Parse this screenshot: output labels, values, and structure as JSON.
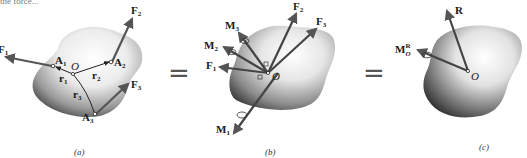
{
  "figure": {
    "top_text_fragment": "the force...",
    "panels": [
      {
        "id": "a",
        "caption": "(a)",
        "labels": {
          "F1": "F",
          "F1_sub": "1",
          "F2": "F",
          "F2_sub": "2",
          "F3": "F",
          "F3_sub": "3",
          "A1": "A",
          "A1_sub": "1",
          "A2": "A",
          "A2_sub": "2",
          "A3": "A",
          "A3_sub": "3",
          "r1": "r",
          "r1_sub": "1",
          "r2": "r",
          "r2_sub": "2",
          "r3": "r",
          "r3_sub": "3",
          "O": "O"
        }
      },
      {
        "id": "b",
        "caption": "(b)",
        "labels": {
          "F1": "F",
          "F1_sub": "1",
          "F2": "F",
          "F2_sub": "2",
          "F3": "F",
          "F3_sub": "3",
          "M1": "M",
          "M1_sub": "1",
          "M2": "M",
          "M2_sub": "2",
          "M3": "M",
          "M3_sub": "3",
          "O": "O"
        }
      },
      {
        "id": "c",
        "caption": "(c)",
        "labels": {
          "R": "R",
          "MO": "M",
          "MO_sub": "O",
          "MO_sup": "R",
          "O": "O"
        }
      }
    ],
    "equals_sign": "=",
    "colors": {
      "arrow": "#555555",
      "body_light": "#f4f4f4",
      "body_dark": "#555555",
      "text": "#1a1a1a"
    }
  }
}
